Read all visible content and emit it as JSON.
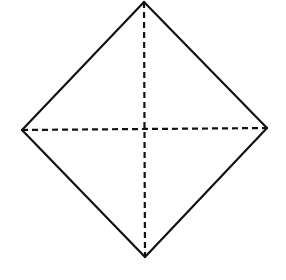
{
  "diagram": {
    "shape": "square rotated 45 degrees (diamond) with dashed diagonals",
    "background": "#ffffff",
    "stroke_color": "#111111",
    "vertices": {
      "top": [
        144,
        2
      ],
      "right": [
        267,
        128
      ],
      "bottom": [
        145,
        257
      ],
      "left": [
        22,
        130
      ]
    },
    "edges": [
      {
        "from": "top",
        "to": "right",
        "style": "solid"
      },
      {
        "from": "right",
        "to": "bottom",
        "style": "solid"
      },
      {
        "from": "bottom",
        "to": "left",
        "style": "solid"
      },
      {
        "from": "left",
        "to": "top",
        "style": "solid"
      }
    ],
    "diagonals": [
      {
        "from": "top",
        "to": "bottom",
        "style": "dashed"
      },
      {
        "from": "left",
        "to": "right",
        "style": "dashed"
      }
    ],
    "solid_width": 2.2,
    "dash_width": 2.2,
    "dash_pattern": "6 4"
  }
}
